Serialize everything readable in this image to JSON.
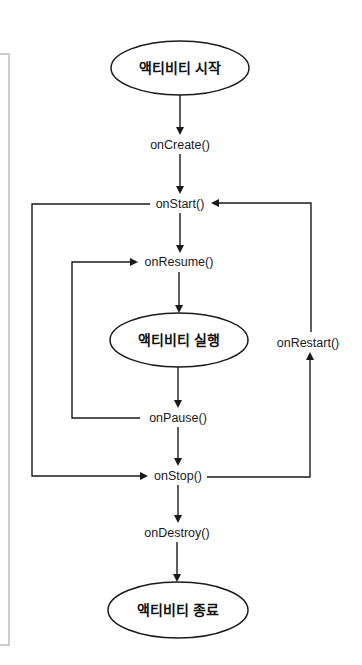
{
  "diagram": {
    "states": {
      "start": "액티비티 시작",
      "running": "액티비티 실행",
      "end": "액티비티 종료"
    },
    "callbacks": {
      "onCreate": "onCreate()",
      "onStart": "onStart()",
      "onResume": "onResume()",
      "onPause": "onPause()",
      "onStop": "onStop()",
      "onDestroy": "onDestroy()",
      "onRestart": "onRestart()"
    },
    "edges": [
      {
        "from": "start",
        "to": "onCreate"
      },
      {
        "from": "onCreate",
        "to": "onStart"
      },
      {
        "from": "onStart",
        "to": "onResume"
      },
      {
        "from": "onResume",
        "to": "running"
      },
      {
        "from": "running",
        "to": "onPause"
      },
      {
        "from": "onPause",
        "to": "onResume"
      },
      {
        "from": "onPause",
        "to": "onStop"
      },
      {
        "from": "onStart",
        "to": "onStop"
      },
      {
        "from": "onStop",
        "to": "onRestart"
      },
      {
        "from": "onRestart",
        "to": "onStart"
      },
      {
        "from": "onStop",
        "to": "onDestroy"
      },
      {
        "from": "onDestroy",
        "to": "end"
      }
    ]
  }
}
